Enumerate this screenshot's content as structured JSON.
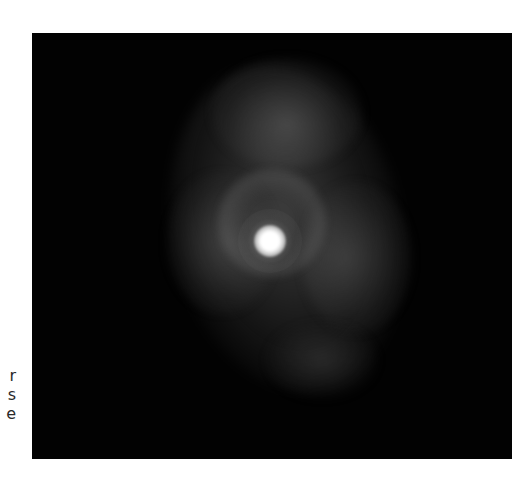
{
  "page": {
    "background": "#ffffff"
  },
  "text_fragments": {
    "lines": [
      "r",
      "s",
      "e"
    ]
  },
  "figure": {
    "background": "#020202",
    "central_star_color": "#ffffff",
    "nebula_color": "#6e6e6e"
  }
}
